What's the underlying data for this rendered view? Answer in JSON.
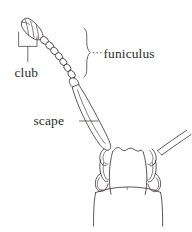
{
  "figure": {
    "title": "Weevil antenna structure diagram",
    "background_color": "#ffffff",
    "ink_color": "#3c3a38",
    "text_color": "#2e2c2b",
    "width": 192,
    "height": 232
  },
  "labels": {
    "club": "club",
    "funiculus": "funiculus",
    "scape": "scape"
  },
  "annotations": {
    "club_connector": "square-bracket-with-vertical-leader",
    "funiculus_connector": "curly-brace-with-dotted-leader",
    "scape_connector": "horizontal-leader-line"
  },
  "parts": {
    "club": {
      "name": "club",
      "description": "elongate oval terminal club with three oblique segment divisions",
      "segment_count": 3
    },
    "funiculus": {
      "name": "funiculus",
      "description": "chain of small bead-like segments between scape and club",
      "segment_count": 7
    },
    "scape": {
      "name": "scape",
      "description": "long basal antennal segment, tapering, inserted in rostral scrobe"
    },
    "rostrum": {
      "name": "rostrum",
      "description": "beetle snout and head outline with antennal scrobes"
    },
    "second_antenna": {
      "name": "opposite-antenna-scape",
      "description": "partial scape of the opposite antenna at upper right"
    }
  }
}
